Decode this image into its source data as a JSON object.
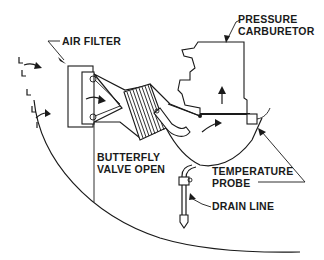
{
  "diagram": {
    "labels": {
      "air_filter": "AIR FILTER",
      "pressure_carburetor_line1": "PRESSURE",
      "pressure_carburetor_line2": "CARBURETOR",
      "butterfly_line1": "BUTTERFLY",
      "butterfly_line2": "VALVE OPEN",
      "temperature_probe_line1": "TEMPERATURE",
      "temperature_probe_line2": "PROBE",
      "drain_line": "DRAIN LINE"
    },
    "components": [
      "air-filter",
      "pressure-carburetor",
      "butterfly-valve",
      "temperature-probe",
      "drain-line",
      "induction-hose",
      "airbox",
      "cowling"
    ],
    "colors": {
      "ink": "#1a1a1a",
      "background": "#ffffff"
    }
  }
}
